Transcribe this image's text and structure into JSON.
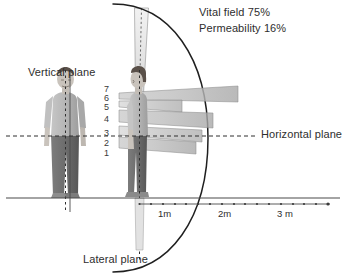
{
  "diagram": {
    "annotations": [
      {
        "id": "vital-field",
        "text": "Vital field 75%"
      },
      {
        "id": "permeability",
        "text": "Permeability 16%"
      }
    ],
    "plane_labels": [
      {
        "id": "vertical-plane",
        "text": "Vertical plane"
      },
      {
        "id": "horizontal-plane",
        "text": "Horizontal plane"
      },
      {
        "id": "lateral-plane",
        "text": "Lateral plane"
      }
    ],
    "level_scale": {
      "description": "Numbered emission levels on profile figure, top to bottom",
      "values": [
        "7",
        "6",
        "5",
        "4",
        "3",
        "2",
        "1"
      ]
    },
    "ruler": {
      "unit": "m",
      "ticks": [
        {
          "label": "1m",
          "value": 1
        },
        {
          "label": "2m",
          "value": 2
        },
        {
          "label": "3 m",
          "value": 3
        }
      ]
    },
    "beams": {
      "description": "Gray gradient wedge emissions projecting forward from the profile figure",
      "count": 5,
      "reach_m": [
        2.2,
        1.55,
        1.75,
        1.65,
        1.6
      ]
    },
    "colors": {
      "ink": "#2b2b2b",
      "arc": "#1f1f1f",
      "beam_light": "#e9e9e9",
      "beam_dark": "#9a9a9a",
      "figure_skin": "#c9c3bc",
      "figure_shirt": "#b9b9b9",
      "figure_pants": "#6f6f6f",
      "ground": "#4a4a4a"
    }
  }
}
